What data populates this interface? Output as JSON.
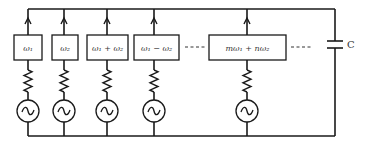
{
  "diagram": {
    "title": "",
    "branches": [
      {
        "label": "ω₁"
      },
      {
        "label": "ω₂"
      },
      {
        "label": "ω₁ + ω₂"
      },
      {
        "label": "ω₁ − ω₂"
      },
      {
        "label": "mω₁ + nω₂"
      }
    ],
    "ellipsis": "----",
    "capacitor_label": "C",
    "components": {
      "source": "ac-voltage-source",
      "resistor": "resistor",
      "filter": "frequency-box",
      "current_direction": "up"
    }
  }
}
